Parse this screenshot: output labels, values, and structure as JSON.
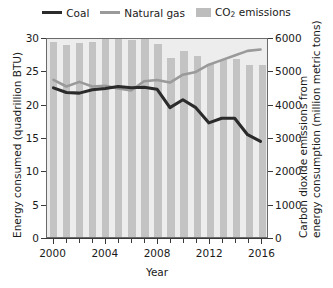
{
  "legend": {
    "items": [
      {
        "label": "Coal",
        "marker": "line",
        "color": "#2b2b2b",
        "name": "legend-coal"
      },
      {
        "label": "Natural gas",
        "marker": "line",
        "color": "#9a9a9a",
        "name": "legend-natural-gas"
      },
      {
        "label": "CO2 emissions",
        "label_main": "CO",
        "label_sub": "2",
        "label_tail": " emissions",
        "marker": "bar",
        "color": "#bdbdbd",
        "name": "legend-co2-emissions"
      }
    ]
  },
  "axes": {
    "x": {
      "title": "Year",
      "ticks": [
        2000,
        2001,
        2002,
        2003,
        2004,
        2005,
        2006,
        2007,
        2008,
        2009,
        2010,
        2011,
        2012,
        2013,
        2014,
        2015,
        2016
      ],
      "labeled_ticks": [
        2000,
        2004,
        2008,
        2012,
        2016
      ],
      "min": 2000,
      "max": 2016
    },
    "y_left": {
      "title": "Energy consumed (quadrillion BTU)",
      "ticks": [
        0,
        5,
        10,
        15,
        20,
        25,
        30
      ],
      "min": 0,
      "max": 30
    },
    "y_right": {
      "title_line1": "Carbon dioxide emissions from",
      "title_line2": "energy consumption (million metric tons)",
      "ticks": [
        0,
        1000,
        2000,
        3000,
        4000,
        5000,
        6000
      ],
      "min": 0,
      "max": 6000
    }
  },
  "chart_data": {
    "type": "bar",
    "title": "",
    "xlabel": "Year",
    "ylabel": "Energy consumed (quadrillion BTU)",
    "y2label": "Carbon dioxide emissions from energy consumption (million metric tons)",
    "xlim": [
      2000,
      2016
    ],
    "ylim": [
      0,
      30
    ],
    "y2lim": [
      0,
      6000
    ],
    "grid": false,
    "legend_position": "top",
    "categories": [
      2000,
      2001,
      2002,
      2003,
      2004,
      2005,
      2006,
      2007,
      2008,
      2009,
      2010,
      2011,
      2012,
      2013,
      2014,
      2015,
      2016
    ],
    "series": [
      {
        "name": "CO2 emissions",
        "type": "bar",
        "axis": "right",
        "unit": "million metric tons",
        "color": "#c3c3c3",
        "values": [
          5860,
          5760,
          5810,
          5850,
          5950,
          5980,
          5920,
          6000,
          5780,
          5370,
          5580,
          5440,
          5200,
          5300,
          5330,
          5170,
          5150
        ]
      },
      {
        "name": "Coal",
        "type": "line",
        "axis": "left",
        "unit": "quadrillion BTU",
        "color": "#2b2b2b",
        "values": [
          22.6,
          21.9,
          21.8,
          22.3,
          22.5,
          22.8,
          22.6,
          22.7,
          22.4,
          19.6,
          20.8,
          19.6,
          17.3,
          18.0,
          18.0,
          15.5,
          14.5
        ]
      },
      {
        "name": "Natural gas",
        "type": "line",
        "axis": "left",
        "unit": "quadrillion BTU",
        "color": "#9a9a9a",
        "values": [
          23.8,
          22.8,
          23.5,
          22.8,
          22.9,
          22.5,
          22.2,
          23.6,
          23.8,
          23.4,
          24.6,
          25.0,
          26.1,
          26.8,
          27.5,
          28.2,
          28.4
        ]
      }
    ]
  }
}
